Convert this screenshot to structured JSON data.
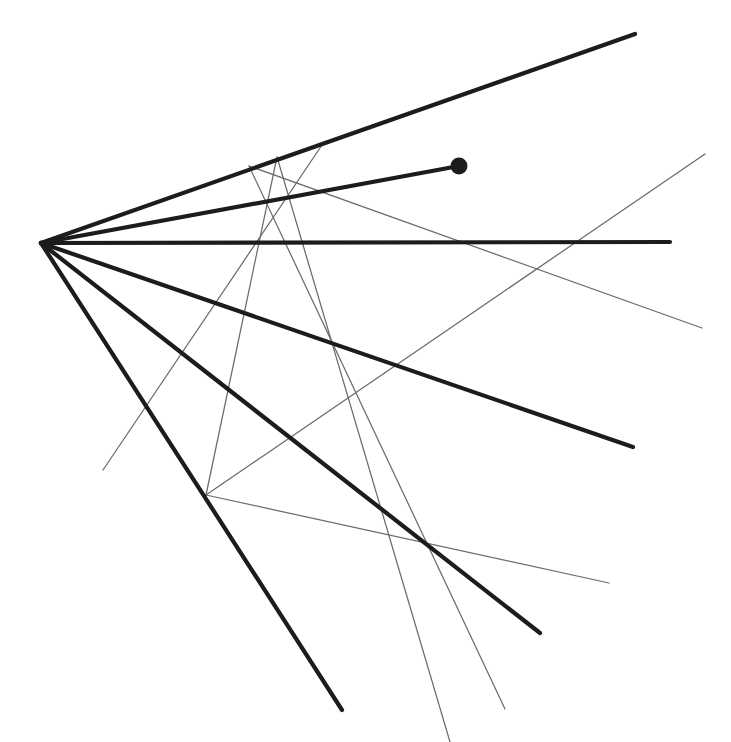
{
  "page": {
    "width": 731,
    "height": 742,
    "background_color": "#ffffff"
  },
  "caption": {
    "text": "schematic looks like this:",
    "clipped": "top-cropped text line"
  },
  "figure": {
    "apex_label": "apex",
    "marker_label": "endpoint dot"
  },
  "chart_data": {
    "type": "scatter",
    "title": "schematic looks like this:",
    "xlabel": "",
    "ylabel": "",
    "xlim": [
      0,
      731
    ],
    "ylim": [
      0,
      742
    ],
    "grid": false,
    "legend": "none",
    "colors": {
      "thick_stroke": "#1c1c1c",
      "thin_stroke": "#6b6b6b",
      "marker_fill": "#1c1c1c",
      "background": "#ffffff"
    },
    "stroke_widths": {
      "thick": 4.2,
      "thin": 1.25
    },
    "apex": {
      "x": 41,
      "y": 243
    },
    "marker_points": [
      {
        "x": 459,
        "y": 166,
        "r": 8.5,
        "fill": "#1c1c1c"
      }
    ],
    "series": [
      {
        "name": "thick-rays",
        "style": "thick",
        "color": "#1c1c1c",
        "width": 4.2,
        "segments": [
          {
            "id": "ray-upper",
            "x1": 41,
            "y1": 243,
            "x2": 635,
            "y2": 34
          },
          {
            "id": "ray-horizontal",
            "x1": 41,
            "y1": 243,
            "x2": 670,
            "y2": 242
          },
          {
            "id": "ray-to-dot",
            "x1": 41,
            "y1": 243,
            "x2": 459,
            "y2": 166
          },
          {
            "id": "ray-lower-1",
            "x1": 41,
            "y1": 243,
            "x2": 633,
            "y2": 447
          },
          {
            "id": "ray-lower-2",
            "x1": 41,
            "y1": 243,
            "x2": 540,
            "y2": 633
          },
          {
            "id": "ray-lower-3",
            "x1": 41,
            "y1": 243,
            "x2": 342,
            "y2": 710
          }
        ]
      },
      {
        "name": "thin-network",
        "style": "thin",
        "color": "#6b6b6b",
        "width": 1.25,
        "segments": [
          {
            "id": "thin-a",
            "x1": 249,
            "y1": 166,
            "x2": 505,
            "y2": 709
          },
          {
            "id": "thin-b",
            "x1": 277,
            "y1": 157,
            "x2": 206,
            "y2": 495
          },
          {
            "id": "thin-c",
            "x1": 322,
            "y1": 145,
            "x2": 103,
            "y2": 470
          },
          {
            "id": "thin-d",
            "x1": 705,
            "y1": 154,
            "x2": 206,
            "y2": 495
          },
          {
            "id": "thin-e",
            "x1": 702,
            "y1": 328,
            "x2": 249,
            "y2": 166
          },
          {
            "id": "thin-f",
            "x1": 206,
            "y1": 495,
            "x2": 609,
            "y2": 583
          },
          {
            "id": "thin-g",
            "x1": 277,
            "y1": 157,
            "x2": 450,
            "y2": 742
          }
        ]
      }
    ]
  }
}
